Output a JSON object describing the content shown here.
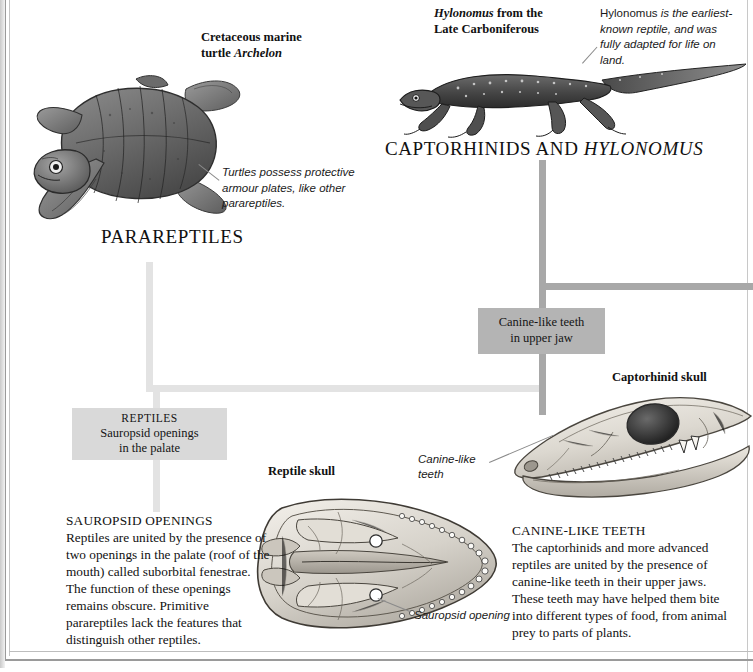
{
  "page": {
    "section_headings": [
      {
        "text": "PARAREPTILES",
        "italic_part": ""
      },
      {
        "text": "CAPTORHINIDS AND ",
        "italic_part": "HYLONOMUS"
      }
    ]
  },
  "figures": {
    "archelon": {
      "title_line1": "Cretaceous marine",
      "title_line2_plain": "turtle ",
      "title_line2_italic": "Archelon",
      "heading": "PARAREPTILES",
      "annotation": "Turtles possess protective armour plates, like other parareptiles."
    },
    "hylonomus": {
      "title_line1_italic": "Hylonomus",
      "title_line1_plain": " from the",
      "title_line2": "Late Carboniferous",
      "heading_plain": "CAPTORHINIDS AND ",
      "heading_italic": "HYLONOMUS",
      "annotation_rom": "Hylonomus",
      "annotation_it": " is the earliest-known reptile, and was fully adapted for life on land."
    },
    "reptile_skull": {
      "title": "Reptile skull",
      "callout": "Sauropsid opening"
    },
    "captorhinid_skull": {
      "title": "Captorhinid skull",
      "callout": "Canine-like teeth"
    }
  },
  "cladogram": {
    "nodes": [
      {
        "id": "canine-like-teeth",
        "line1": "Canine-like teeth",
        "line2": "in upper jaw"
      },
      {
        "id": "reptiles",
        "caption": "REPTILES",
        "line1": "Sauropsid openings",
        "line2": "in the palate"
      }
    ]
  },
  "text_blocks": {
    "sauropsid": {
      "heading": "SAUROPSID OPENINGS",
      "body": "Reptiles are united by the presence of two openings in the palate (roof of the mouth) called suborbital fenestrae. The function of these openings remains obscure. Primitive parareptiles lack the features that distinguish other reptiles."
    },
    "canine": {
      "heading": "CANINE-LIKE TEETH",
      "body": "The captorhinids and more advanced reptiles are united by the presence of canine-like teeth in their upper jaws. These teeth may have helped them bite into different types of food, from animal prey to parts of plants."
    }
  },
  "colors": {
    "branch_light": "#e3e3e3",
    "branch_dark": "#a8a8a8",
    "box_light": "#d9d9d9",
    "box_dark": "#b4b4b4",
    "text": "#111111"
  }
}
